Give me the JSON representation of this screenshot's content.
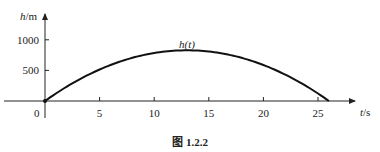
{
  "chart_data": {
    "type": "line",
    "title": "",
    "caption": "图 1.2.2",
    "xlabel": "t/s",
    "ylabel": "h/m",
    "xlabel_var": "t",
    "xlabel_unit": "/s",
    "ylabel_var": "h",
    "ylabel_unit": "/m",
    "x_ticks": [
      0,
      5,
      10,
      15,
      20,
      25
    ],
    "y_ticks": [
      500,
      1000
    ],
    "origin_label": "0",
    "xlim": [
      0,
      28
    ],
    "ylim": [
      0,
      1100
    ],
    "grid": false,
    "series": [
      {
        "name": "h(t)",
        "x": [
          0,
          2,
          4,
          6,
          8,
          10,
          12,
          13,
          14,
          16,
          18,
          20,
          22,
          24,
          26
        ],
        "y": [
          0,
          235.2,
          431.2,
          588.0,
          705.6,
          784.0,
          823.2,
          828.1,
          823.2,
          784.0,
          705.6,
          588.0,
          431.2,
          235.2,
          0
        ]
      }
    ],
    "annotations": [
      {
        "text": "h(t)",
        "x": 13,
        "y": 880
      }
    ]
  }
}
